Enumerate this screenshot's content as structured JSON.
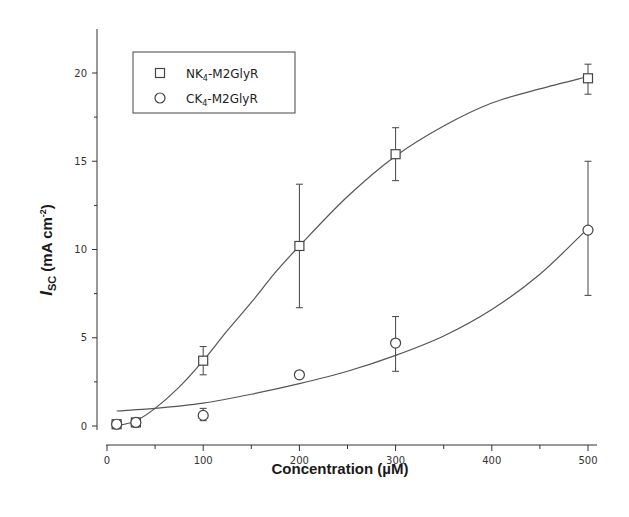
{
  "chart_data": {
    "type": "scatter",
    "title": "",
    "xlabel": "Concentration (µM)",
    "ylabel": "I_SC (mA cm^-2)",
    "ylabel_parts": {
      "main": "I",
      "sub": "SC",
      "unit": " (mA cm",
      "sup": "-2",
      "close": ")"
    },
    "xlim": [
      0,
      520
    ],
    "ylim": [
      0,
      22
    ],
    "xticks": [
      0,
      100,
      200,
      300,
      400,
      500
    ],
    "xticks_minor": [
      50,
      150,
      250,
      350,
      450
    ],
    "yticks": [
      0,
      5,
      10,
      15,
      20
    ],
    "yticks_minor": [
      2.5,
      7.5,
      12.5,
      17.5
    ],
    "grid": false,
    "legend_position": "upper-left",
    "series": [
      {
        "name": "NK4-M2GlyR",
        "label_main": "NK",
        "label_sub": "4",
        "label_rest": "-M2GlyR",
        "marker": "square",
        "x": [
          10,
          30,
          100,
          200,
          300,
          500
        ],
        "y": [
          0.1,
          0.2,
          3.7,
          10.2,
          15.4,
          19.7
        ],
        "err_low": [
          0.1,
          0.1,
          2.9,
          6.7,
          13.9,
          18.8
        ],
        "err_high": [
          0.2,
          0.3,
          4.5,
          13.7,
          16.9,
          20.5
        ],
        "fit": {
          "x": [
            10,
            30,
            50,
            75,
            100,
            125,
            150,
            175,
            200,
            250,
            300,
            350,
            400,
            450,
            500
          ],
          "y": [
            0.0,
            0.3,
            1.0,
            2.2,
            3.7,
            5.4,
            7.0,
            8.7,
            10.2,
            13.0,
            15.3,
            17.0,
            18.3,
            19.1,
            19.8
          ]
        }
      },
      {
        "name": "CK4-M2GlyR",
        "label_main": "CK",
        "label_sub": "4",
        "label_rest": "-M2GlyR",
        "marker": "circle",
        "x": [
          10,
          30,
          100,
          200,
          300,
          500
        ],
        "y": [
          0.1,
          0.2,
          0.6,
          2.9,
          4.7,
          11.1
        ],
        "err_low": [
          0.0,
          0.1,
          0.3,
          2.9,
          3.1,
          7.4
        ],
        "err_high": [
          0.2,
          0.3,
          1.0,
          2.9,
          6.2,
          15.0
        ],
        "fit": {
          "x": [
            10,
            50,
            100,
            150,
            200,
            250,
            300,
            350,
            400,
            450,
            500
          ],
          "y": [
            0.85,
            1.0,
            1.3,
            1.8,
            2.4,
            3.1,
            4.0,
            5.1,
            6.6,
            8.6,
            11.2
          ]
        }
      }
    ]
  },
  "plot_area": {
    "x0_px": 107,
    "x_scale": 0.962,
    "y0_px": 426,
    "y_scale": 17.65
  },
  "colors": {
    "axis": "#333333",
    "curve": "#555555",
    "marker": "#444444"
  }
}
